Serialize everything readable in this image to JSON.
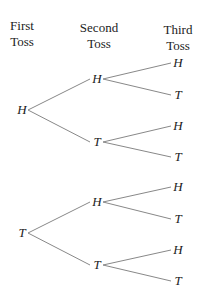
{
  "headers": {
    "first": [
      "First",
      "Toss"
    ],
    "second": [
      "Second",
      "Toss"
    ],
    "third": [
      "Third",
      "Toss"
    ]
  },
  "tree": {
    "first": [
      {
        "label": "H",
        "x": 22,
        "y": 110
      },
      {
        "label": "T",
        "x": 22,
        "y": 233
      }
    ],
    "second": [
      {
        "label": "H",
        "x": 97,
        "y": 79,
        "parent": 0
      },
      {
        "label": "T",
        "x": 97,
        "y": 142,
        "parent": 0
      },
      {
        "label": "H",
        "x": 97,
        "y": 202,
        "parent": 1
      },
      {
        "label": "T",
        "x": 97,
        "y": 265,
        "parent": 1
      }
    ],
    "third": [
      {
        "label": "H",
        "x": 178,
        "y": 63,
        "parent": 0
      },
      {
        "label": "T",
        "x": 178,
        "y": 95,
        "parent": 0
      },
      {
        "label": "H",
        "x": 178,
        "y": 126,
        "parent": 1
      },
      {
        "label": "T",
        "x": 178,
        "y": 157,
        "parent": 1
      },
      {
        "label": "H",
        "x": 178,
        "y": 187,
        "parent": 2
      },
      {
        "label": "T",
        "x": 178,
        "y": 219,
        "parent": 2
      },
      {
        "label": "H",
        "x": 178,
        "y": 250,
        "parent": 3
      },
      {
        "label": "T",
        "x": 178,
        "y": 281,
        "parent": 3
      }
    ]
  },
  "line_color": "#888888"
}
